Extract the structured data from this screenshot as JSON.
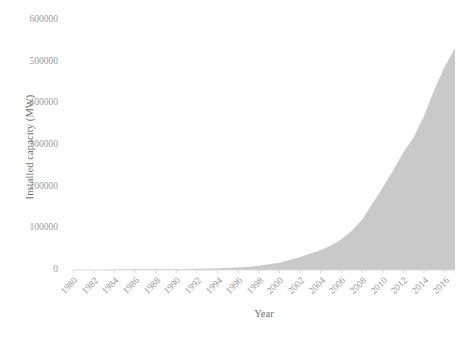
{
  "chart_data": {
    "type": "area",
    "title": "",
    "subtitle": "",
    "xlabel": "Year",
    "ylabel": "Installed capacity (MW)",
    "x": [
      1980,
      1981,
      1982,
      1983,
      1984,
      1985,
      1986,
      1987,
      1988,
      1989,
      1990,
      1991,
      1992,
      1993,
      1994,
      1995,
      1996,
      1997,
      1998,
      1999,
      2000,
      2001,
      2002,
      2003,
      2004,
      2005,
      2006,
      2007,
      2008,
      2009,
      2010,
      2011,
      2012,
      2013,
      2014,
      2015,
      2016,
      2017
    ],
    "values": [
      10,
      90,
      270,
      600,
      1000,
      1300,
      1600,
      1800,
      1950,
      2100,
      2300,
      2600,
      3000,
      3500,
      4200,
      5100,
      6100,
      7600,
      10200,
      13600,
      17400,
      23900,
      31100,
      39431,
      47620,
      59091,
      73938,
      93924,
      120696,
      159052,
      197956,
      238110,
      282850,
      318608,
      369862,
      432680,
      487657,
      532000
    ],
    "series": [
      {
        "name": "Installed capacity",
        "values": [
          10,
          90,
          270,
          600,
          1000,
          1300,
          1600,
          1800,
          1950,
          2100,
          2300,
          2600,
          3000,
          3500,
          4200,
          5100,
          6100,
          7600,
          10200,
          13600,
          17400,
          23900,
          31100,
          39431,
          47620,
          59091,
          73938,
          93924,
          120696,
          159052,
          197956,
          238110,
          282850,
          318608,
          369862,
          432680,
          487657,
          532000
        ],
        "color": "#c9c9c9"
      }
    ],
    "xlim": [
      1980,
      2017
    ],
    "ylim": [
      0,
      600000
    ],
    "ytick_labels": [
      "0",
      "100000",
      "200000",
      "300000",
      "400000",
      "500000",
      "600000"
    ],
    "ytick_values": [
      0,
      100000,
      200000,
      300000,
      400000,
      500000,
      600000
    ],
    "xtick_labels": [
      "1980",
      "1982",
      "1984",
      "1986",
      "1988",
      "1990",
      "1992",
      "1994",
      "1996",
      "1998",
      "2000",
      "2002",
      "2004",
      "2006",
      "2008",
      "2010",
      "2012",
      "2014",
      "2016"
    ],
    "xtick_values": [
      1980,
      1982,
      1984,
      1986,
      1988,
      1990,
      1992,
      1994,
      1996,
      1998,
      2000,
      2002,
      2004,
      2006,
      2008,
      2010,
      2012,
      2014,
      2016
    ],
    "grid": false,
    "legend": "none",
    "fill_color": "#c9c9c9",
    "axis_color": "#d9d9d9",
    "tick_text_color": "#9a9a9a",
    "label_text_color": "#6f6f6f"
  }
}
